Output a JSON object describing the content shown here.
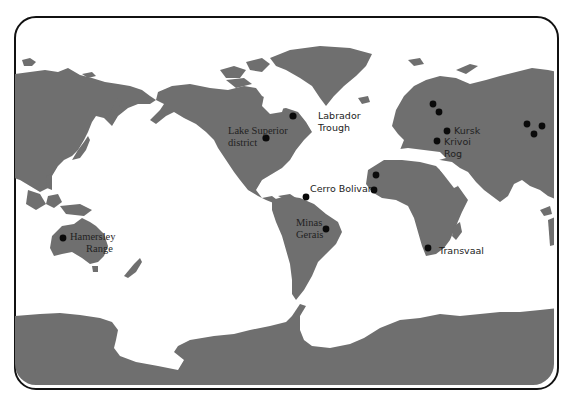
{
  "map": {
    "title": "World iron ore deposits",
    "colors": {
      "land": "#6f6f6f",
      "ocean": "#ffffff",
      "marker": "#0a0a0a",
      "frame": "#111111"
    },
    "deposits": [
      {
        "id": "lake-superior",
        "label_line1": "Lake Superior",
        "label_line2": "district"
      },
      {
        "id": "labrador",
        "label_line1": "Labrador",
        "label_line2": "Trough"
      },
      {
        "id": "kursk",
        "label_line1": "Kursk"
      },
      {
        "id": "krivoi-rog",
        "label_line1": "Krivoi",
        "label_line2": "Rog"
      },
      {
        "id": "cerro-bolivar",
        "label_line1": "Cerro Bolivar"
      },
      {
        "id": "minas-gerais",
        "label_line1": "Minas",
        "label_line2": "Gerais"
      },
      {
        "id": "transvaal",
        "label_line1": "Transvaal"
      },
      {
        "id": "hamersley",
        "label_line1": "Hamersley",
        "label_line2": "Range"
      }
    ],
    "unlabeled_markers": {
      "scandinavia_russia_northwest": 2,
      "west_africa": 2,
      "central_siberia": 3
    }
  }
}
